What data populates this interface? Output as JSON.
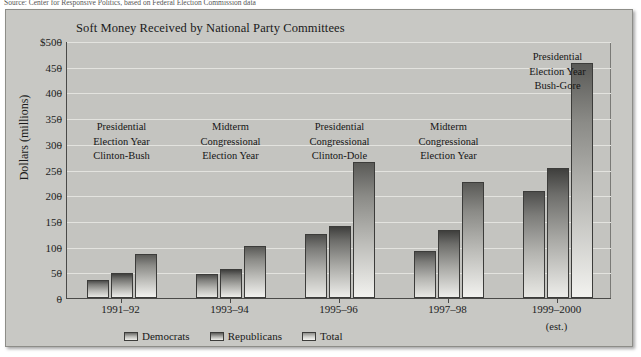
{
  "source_note": "Source: Center for Responsive Politics, based on Federal Election Commission data",
  "figure": {
    "title": "Soft Money Received by National Party Committees",
    "est_note": "(est.)"
  },
  "legend": {
    "items": [
      {
        "label": "Democrats",
        "key": "dem"
      },
      {
        "label": "Republicans",
        "key": "rep"
      },
      {
        "label": "Total",
        "key": "tot"
      }
    ]
  },
  "chart_data": {
    "type": "bar",
    "title": "Soft Money Received by National Party Committees",
    "xlabel": "",
    "ylabel": "Dollars (millions)",
    "ylim": [
      0,
      500
    ],
    "ytick_labels": [
      "$500",
      "450",
      "400",
      "350",
      "300",
      "250",
      "200",
      "150",
      "100",
      "50",
      "0"
    ],
    "yticks": [
      500,
      450,
      400,
      350,
      300,
      250,
      200,
      150,
      100,
      50,
      0
    ],
    "grid": true,
    "legend_position": "bottom",
    "categories": [
      "1991–92",
      "1993–94",
      "1995–96",
      "1997–98",
      "1999–2000"
    ],
    "series": [
      {
        "name": "Democrats",
        "values": [
          36,
          46,
          124,
          92,
          208
        ]
      },
      {
        "name": "Republicans",
        "values": [
          48,
          56,
          141,
          132,
          253
        ]
      },
      {
        "name": "Total",
        "values": [
          85,
          102,
          264,
          225,
          457
        ]
      }
    ],
    "annotations": [
      {
        "category": "1991–92",
        "lines": [
          "Presidential",
          "Election Year",
          "Clinton-Bush"
        ]
      },
      {
        "category": "1993–94",
        "lines": [
          "Midterm",
          "Congressional",
          "Election Year"
        ]
      },
      {
        "category": "1995–96",
        "lines": [
          "Presidential",
          "Congressional",
          "Clinton-Dole"
        ]
      },
      {
        "category": "1997–98",
        "lines": [
          "Midterm",
          "Congressional",
          "Election Year"
        ]
      },
      {
        "category": "1999–2000",
        "lines": [
          "Presidential",
          "Election Year",
          "Bush-Gore"
        ]
      }
    ]
  }
}
